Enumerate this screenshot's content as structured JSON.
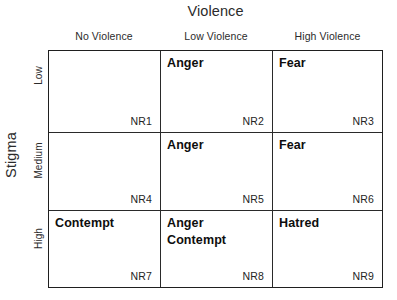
{
  "diagram": {
    "column_axis_title": "Violence",
    "row_axis_title": "Stigma",
    "column_headers": [
      "No Violence",
      "Low Violence",
      "High Violence"
    ],
    "row_headers": [
      "Low",
      "Medium",
      "High"
    ],
    "cells": [
      {
        "code": "NR1",
        "emotions": []
      },
      {
        "code": "NR2",
        "emotions": [
          "Anger"
        ]
      },
      {
        "code": "NR3",
        "emotions": [
          "Fear"
        ]
      },
      {
        "code": "NR4",
        "emotions": []
      },
      {
        "code": "NR5",
        "emotions": [
          "Anger"
        ]
      },
      {
        "code": "NR6",
        "emotions": [
          "Fear"
        ]
      },
      {
        "code": "NR7",
        "emotions": [
          "Contempt"
        ]
      },
      {
        "code": "NR8",
        "emotions": [
          "Anger",
          "Contempt"
        ]
      },
      {
        "code": "NR9",
        "emotions": [
          "Hatred"
        ]
      }
    ],
    "cell_text": {
      "c0": "",
      "c1": "Anger",
      "c2": "Fear",
      "c3": "",
      "c4": "Anger",
      "c5": "Fear",
      "c6": "Contempt",
      "c7_line1": "Anger",
      "c7_line2": "Contempt",
      "c8": "Hatred"
    },
    "codes": {
      "c0": "NR1",
      "c1": "NR2",
      "c2": "NR3",
      "c3": "NR4",
      "c4": "NR5",
      "c5": "NR6",
      "c6": "NR7",
      "c7": "NR8",
      "c8": "NR9"
    },
    "colors": {
      "background": "#ffffff",
      "border": "#1f1f1f",
      "gridline": "#2a2a2a",
      "text": "#1a1a1a"
    }
  }
}
